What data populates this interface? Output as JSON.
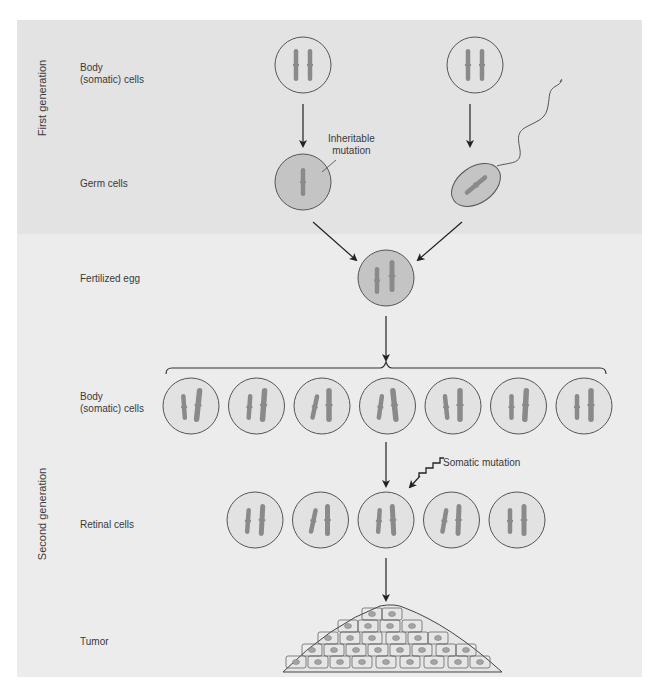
{
  "sections": {
    "first_generation": "First generation",
    "second_generation": "Second generation"
  },
  "row_labels": {
    "body_cells_1": "Body\n(somatic) cells",
    "germ_cells": "Germ cells",
    "fertilized_egg": "Fertilized egg",
    "body_cells_2": "Body\n(somatic) cells",
    "retinal_cells": "Retinal cells",
    "tumor": "Tumor"
  },
  "annotations": {
    "inheritable_mutation": "Inheritable\nmutation",
    "somatic_mutation": "Somatic mutation"
  },
  "counts": {
    "body_cells_second_generation": 7,
    "retinal_cells": 5
  },
  "colors": {
    "panel_top": "#e4e4e4",
    "panel_bottom": "#ececec",
    "cell_fill_light": "#e2e2e2",
    "cell_fill_germ": "#c4c4c4",
    "cell_stroke": "#555555",
    "chromosome": "#8a8a8a",
    "arrow": "#222222"
  }
}
